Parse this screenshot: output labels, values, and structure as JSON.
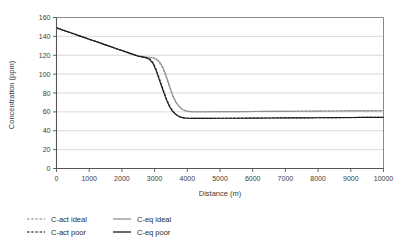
{
  "chart_data": {
    "type": "line",
    "title": "",
    "xlabel": "Distance (m)",
    "ylabel": "Concentration (ppm)",
    "xlim": [
      0,
      10000
    ],
    "ylim": [
      0,
      160
    ],
    "xticks": [
      0,
      1000,
      2000,
      3000,
      4000,
      5000,
      6000,
      7000,
      8000,
      9000,
      10000
    ],
    "yticks": [
      0,
      20,
      40,
      60,
      80,
      100,
      120,
      140,
      160
    ],
    "grid": "horizontal",
    "legend_position": "below",
    "colors": {
      "c_act_ideal": "#a8a8a8",
      "c_act_poor": "#555555",
      "c_eq_ideal": "#909090",
      "c_eq_poor": "#1a1a1a",
      "gridline": "#cfcfcf",
      "axis": "#555555",
      "plot_border": "#8a8a8a"
    },
    "x": [
      0,
      250,
      500,
      750,
      1000,
      1250,
      1500,
      1750,
      2000,
      2250,
      2500,
      2650,
      2750,
      2850,
      2950,
      3050,
      3150,
      3250,
      3350,
      3450,
      3550,
      3650,
      3750,
      3850,
      3950,
      4050,
      4150,
      4250,
      4400,
      4600,
      5000,
      5500,
      6000,
      6500,
      7000,
      7500,
      8000,
      8500,
      9000,
      9500,
      10000
    ],
    "series": [
      {
        "name": "C-act ideal",
        "style": "dashed",
        "color": "#a8a8a8",
        "values": [
          149,
          146,
          143,
          140,
          137,
          134,
          131,
          128,
          125,
          122,
          119.5,
          118.5,
          118,
          117.6,
          117,
          115.5,
          112,
          106,
          97,
          87,
          77,
          70,
          65.5,
          62.5,
          61,
          60.4,
          60.2,
          60.1,
          60.1,
          60.1,
          60.2,
          60.3,
          60.4,
          60.5,
          60.6,
          60.7,
          60.8,
          60.9,
          61,
          61.1,
          61.2
        ]
      },
      {
        "name": "C-act poor",
        "style": "dashed",
        "color": "#555555",
        "values": [
          149,
          146,
          143,
          140,
          137,
          134,
          131,
          128,
          125,
          122,
          119,
          118,
          117.4,
          116,
          112.5,
          105,
          95,
          85,
          75,
          67,
          61,
          57.5,
          55.2,
          54,
          53.4,
          53.2,
          53.1,
          53.1,
          53.1,
          53.1,
          53.2,
          53.3,
          53.4,
          53.5,
          53.6,
          53.7,
          53.8,
          53.9,
          54,
          54.1,
          54.2
        ]
      },
      {
        "name": "C-eq ideal",
        "style": "solid",
        "color": "#909090",
        "values": [
          149,
          146,
          143,
          140,
          137,
          134,
          131,
          128,
          125,
          122,
          119.5,
          118.6,
          118.2,
          117.9,
          117.4,
          116,
          113,
          107.5,
          98.5,
          88,
          78,
          70.5,
          65.8,
          62.6,
          61.1,
          60.5,
          60.2,
          60.1,
          60.1,
          60.1,
          60.2,
          60.3,
          60.4,
          60.5,
          60.6,
          60.7,
          60.8,
          60.9,
          61,
          61.1,
          61.2
        ]
      },
      {
        "name": "C-eq poor",
        "style": "solid",
        "color": "#1a1a1a",
        "values": [
          149,
          146,
          143,
          140,
          137,
          134,
          131,
          128,
          125,
          122,
          119,
          118,
          117.2,
          115.5,
          111.5,
          103.5,
          93.5,
          83.5,
          74,
          66,
          60.5,
          57.2,
          55,
          53.9,
          53.4,
          53.2,
          53.1,
          53.1,
          53.1,
          53.1,
          53.2,
          53.3,
          53.4,
          53.5,
          53.6,
          53.7,
          53.8,
          53.9,
          54,
          54.1,
          54.2
        ]
      }
    ]
  },
  "legend": {
    "items": [
      {
        "label": "C-act ideal",
        "style": "dashed",
        "color": "#a8a8a8"
      },
      {
        "label": "C-eq ideal",
        "style": "solid",
        "color": "#909090"
      },
      {
        "label": "C-act poor",
        "style": "dashed",
        "color": "#555555"
      },
      {
        "label": "C-eq poor",
        "style": "solid",
        "color": "#1a1a1a"
      }
    ]
  }
}
